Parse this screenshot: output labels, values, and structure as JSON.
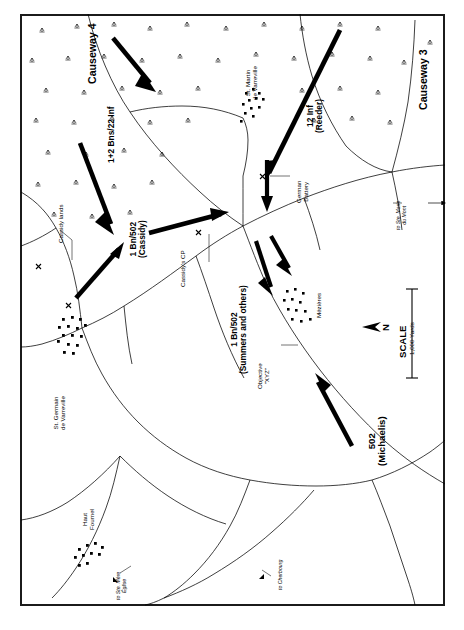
{
  "figure": {
    "type": "military-situation-map",
    "theater": "Utah Beach / Normandy — 101st Airborne Division actions",
    "background_color": "#ffffff",
    "ink_color": "#000000",
    "border_color": "#1b1b1b"
  },
  "unit_arrows": [
    {
      "id": "arrow-1-2-bns-22-inf-north",
      "label": "1+2 Bns/22 Inf",
      "style": "heavy-black-arrow",
      "direction": "southwest"
    },
    {
      "id": "arrow-1-2-bns-22-inf-south",
      "label": "1+2 Bns/22 Inf",
      "style": "heavy-black-arrow",
      "direction": "southwest"
    },
    {
      "id": "arrow-12-inf-reeder",
      "label": "12 Inf (Reeder)",
      "style": "heavy-black-arrow",
      "direction": "southwest"
    },
    {
      "id": "arrow-german-battery-thrust",
      "label": "",
      "style": "heavy-black-arrow",
      "direction": "south"
    },
    {
      "id": "arrow-1-bn-502-cassidy",
      "label": "1 Bn/502 (Cassidy)",
      "style": "heavy-black-arrow",
      "direction": "northeast"
    },
    {
      "id": "arrow-1-bn-502-cassidy-advance",
      "label": "1 Bn/502 (Cassidy)",
      "style": "heavy-black-arrow",
      "direction": "east"
    },
    {
      "id": "arrow-1-bn-502-summers-a",
      "label": "1 Bn/502 (Summers and others)",
      "style": "heavy-black-arrow",
      "direction": "southeast"
    },
    {
      "id": "arrow-1-bn-502-summers-b",
      "label": "1 Bn/502 (Summers and others)",
      "style": "heavy-black-arrow",
      "direction": "southeast"
    },
    {
      "id": "arrow-502-michaelis",
      "label": "502 (Michaelis)",
      "style": "heavy-black-arrow",
      "direction": "northwest"
    }
  ],
  "labels": {
    "causeway_4": "Causeway 4",
    "causeway_3": "Causeway 3",
    "bns_22_inf": "1+2 Bns/22 Inf",
    "inf_12_reeder": "12 Inf\n(Reeder)",
    "st_martin": "St. Martin\nde Varreville",
    "german_battery": "German\nBattery",
    "cassidy_lands": "Cassidy lands",
    "bn_502_cassidy": "1 Bn/502\n(Cassidy)",
    "cassidys_cp": "Cassidy's CP",
    "bn_502_summers": "1 Bn/502\n(Summers and others)",
    "objective_xyz": "Objective\n\"XYZ\"",
    "mezieres": "Mézières",
    "st_germain": "St. Germain\nde Varreville",
    "haut_fournel": "Haut\nFournel",
    "michaelis_502": "502\n(Michaelis)",
    "to_ste_marie_du_mont": "to Ste. Marie\ndu Mont",
    "to_ste_mere_eglise": "to Ste. Mère\nÉglise",
    "to_cherbourg": "to Cherbourg"
  },
  "scale_bar": {
    "title": "SCALE",
    "distance": "1,000 Yards"
  },
  "compass": {
    "label": "N",
    "points": "left"
  },
  "map_features": {
    "marsh_symbol": "inundated-marsh-tuft",
    "village_symbol": "building-block-dot",
    "position_marker": "X",
    "roads": "thin-black-line",
    "villages": [
      "St. Martin de Varreville",
      "St. Germain de Varreville",
      "Mézières",
      "Haut Fournel"
    ]
  }
}
